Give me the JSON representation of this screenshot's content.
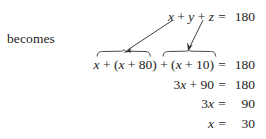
{
  "document": {
    "kind": "algebra-worked-example",
    "intro_label": "becomes",
    "text_color": "#1d1d1d",
    "background_color": "#ffffff"
  },
  "equations": {
    "original": {
      "lhs": "x + y + z",
      "equals": "=",
      "rhs": "180",
      "full": "x + y + z = 180"
    },
    "substituted": {
      "lhs": "x + (x + 80) + (x + 10)",
      "equals": "=",
      "rhs": "180",
      "full": "x + (x + 80) + (x + 10) = 180"
    },
    "combined": {
      "lhs": "3x + 90",
      "equals": "=",
      "rhs": "180",
      "full": "3x + 90 = 180"
    },
    "simplified": {
      "lhs": "3x",
      "equals": "=",
      "rhs": "90",
      "full": "3x = 90"
    },
    "solution": {
      "lhs": "x",
      "equals": "=",
      "rhs": "30",
      "full": "x = 30"
    }
  },
  "annotations": {
    "substitution_arrows": [
      {
        "name": "y-substitution-arrow",
        "from_variable": "y",
        "to_expression": "(x + 80)",
        "start": [
          173,
          20
        ],
        "end": [
          124,
          52
        ]
      },
      {
        "name": "z-substitution-arrow",
        "from_variable": "z",
        "to_expression": "(x + 10)",
        "start": [
          203,
          20
        ],
        "end": [
          188,
          50
        ]
      }
    ],
    "braces": [
      {
        "name": "left-overbrace",
        "covers": "(x + 80)",
        "x_start": 97,
        "x_end": 150,
        "y": 56
      },
      {
        "name": "right-overbrace",
        "covers": "(x + 10)",
        "x_start": 163,
        "x_end": 216,
        "y": 56
      }
    ]
  }
}
